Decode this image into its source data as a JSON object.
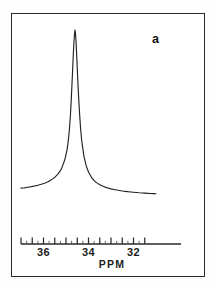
{
  "figure": {
    "panel_label": "a",
    "frame": {
      "x": 11,
      "y": 13,
      "width": 194,
      "height": 264
    }
  },
  "chart_data": {
    "type": "line",
    "title": "",
    "subtitle": "",
    "xlabel": "PPM",
    "ylabel": "",
    "panel_label": "a",
    "grid": false,
    "legend": null,
    "axis_direction": "decreasing-left-to-right",
    "xlim": [
      37.0,
      31.0
    ],
    "ylim": [
      0,
      1.0
    ],
    "tick_labels": [
      "36",
      "34",
      "32"
    ],
    "tick_label_positions_ppm": [
      36,
      34,
      32
    ],
    "major_ticks_ppm": [
      37.0,
      36.5,
      36.0,
      35.5,
      35.0,
      34.5,
      34.0,
      33.5,
      33.0,
      32.5,
      32.0,
      31.5
    ],
    "minor_ticks_ppm": [
      36.75,
      36.25,
      35.75,
      35.25,
      34.75,
      34.25,
      33.75,
      33.25,
      32.75,
      32.25,
      31.75
    ],
    "peak": {
      "center_ppm": 34.6,
      "height": 1.0,
      "half_width_ppm": 0.075,
      "lineshape": "lorentzian"
    },
    "baseline_left": 0.145,
    "baseline_right": 0.115,
    "x": [
      37.0,
      36.85,
      36.7,
      36.55,
      36.4,
      36.25,
      36.1,
      35.95,
      35.8,
      35.65,
      35.5,
      35.35,
      35.2,
      35.05,
      34.95,
      34.9,
      34.85,
      34.8,
      34.76,
      34.72,
      34.68,
      34.65,
      34.62,
      34.6,
      34.58,
      34.55,
      34.52,
      34.48,
      34.44,
      34.4,
      34.35,
      34.3,
      34.2,
      34.1,
      34.0,
      33.85,
      33.7,
      33.55,
      33.4,
      33.2,
      33.0,
      32.75,
      32.5,
      32.25,
      32.0,
      31.75,
      31.5,
      31.25,
      31.0
    ],
    "y": [
      0.145,
      0.147,
      0.15,
      0.153,
      0.157,
      0.161,
      0.166,
      0.172,
      0.18,
      0.19,
      0.203,
      0.222,
      0.25,
      0.3,
      0.355,
      0.4,
      0.46,
      0.545,
      0.64,
      0.745,
      0.855,
      0.93,
      0.98,
      1.0,
      0.985,
      0.93,
      0.85,
      0.74,
      0.64,
      0.555,
      0.465,
      0.4,
      0.315,
      0.265,
      0.232,
      0.2,
      0.18,
      0.167,
      0.158,
      0.148,
      0.141,
      0.135,
      0.13,
      0.126,
      0.123,
      0.12,
      0.118,
      0.116,
      0.115
    ],
    "color": "#222222",
    "line_width": 1.15
  },
  "axis_geometry": {
    "line_y": 244,
    "line_x_start": 21,
    "line_x_end": 181,
    "px_per_ppm": 22.5,
    "ppm_at_x_start": 37.0
  }
}
